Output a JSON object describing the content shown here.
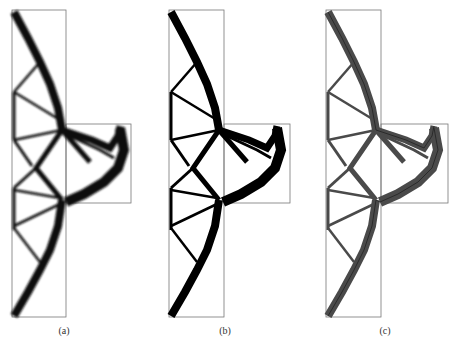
{
  "figure": {
    "panels": [
      {
        "id": "a",
        "label": "(a)",
        "style": "blurred",
        "fill": "#111111",
        "offset_x": 0
      },
      {
        "id": "b",
        "label": "(b)",
        "style": "binary",
        "fill": "#000000",
        "offset_x": 157
      },
      {
        "id": "c",
        "label": "(c)",
        "style": "grey-with-centerline",
        "fill": "#4a4a4a",
        "offset_x": 314
      }
    ],
    "frame_color": "#777777"
  }
}
